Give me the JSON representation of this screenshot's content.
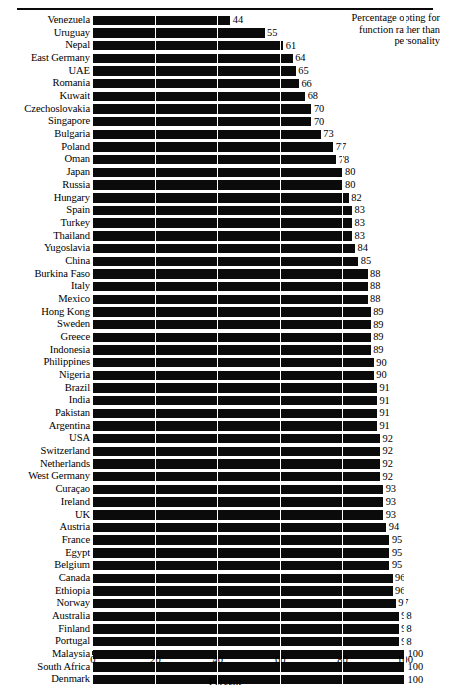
{
  "annotation": {
    "line1": "Percentage opting for",
    "line2": "function rather than",
    "line3": "personality"
  },
  "axis": {
    "title": "Percent",
    "ticks": [
      "0",
      "20",
      "40",
      "60",
      "80",
      "100"
    ]
  },
  "colors": {
    "bar": "#0b0b0b",
    "background": "#ffffff",
    "gridline_over_bar": "#ffffff",
    "rule": "#0a0a0a"
  },
  "chart_data": {
    "type": "bar",
    "orientation": "horizontal",
    "title": "",
    "subtitle": "",
    "annotation": "Percentage opting for function rather than personality",
    "xlabel": "Percent",
    "ylabel": "",
    "xlim": [
      0,
      100
    ],
    "xticks": [
      0,
      20,
      40,
      60,
      80,
      100
    ],
    "grid": "vertical gridlines at 20, 40, 60, 80, 100",
    "legend": "none",
    "value_labels": true,
    "categories": [
      "Venezuela",
      "Uruguay",
      "Nepal",
      "East Germany",
      "UAE",
      "Romania",
      "Kuwait",
      "Czechoslovakia",
      "Singapore",
      "Bulgaria",
      "Poland",
      "Oman",
      "Japan",
      "Russia",
      "Hungary",
      "Spain",
      "Turkey",
      "Thailand",
      "Yugoslavia",
      "China",
      "Burkina Faso",
      "Italy",
      "Mexico",
      "Hong Kong",
      "Sweden",
      "Greece",
      "Indonesia",
      "Philippines",
      "Nigeria",
      "Brazil",
      "India",
      "Pakistan",
      "Argentina",
      "USA",
      "Switzerland",
      "Netherlands",
      "West Germany",
      "Curaçao",
      "Ireland",
      "UK",
      "Austria",
      "France",
      "Egypt",
      "Belgium",
      "Canada",
      "Ethiopia",
      "Norway",
      "Australia",
      "Finland",
      "Portugal",
      "Malaysia",
      "South Africa",
      "Denmark"
    ],
    "values": [
      44,
      55,
      61,
      64,
      65,
      66,
      68,
      70,
      70,
      73,
      77,
      78,
      80,
      80,
      82,
      83,
      83,
      83,
      84,
      85,
      88,
      88,
      88,
      89,
      89,
      89,
      89,
      90,
      90,
      91,
      91,
      91,
      91,
      92,
      92,
      92,
      92,
      93,
      93,
      93,
      94,
      95,
      95,
      95,
      96,
      96,
      97,
      98,
      98,
      98,
      100,
      100,
      100
    ]
  }
}
